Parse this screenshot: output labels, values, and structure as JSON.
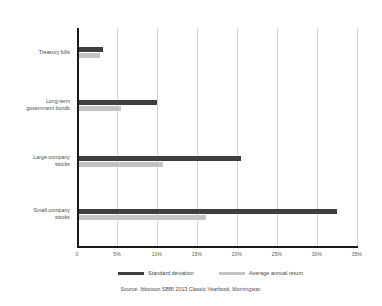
{
  "chart_data": {
    "type": "bar",
    "orientation": "horizontal",
    "title": "",
    "xlabel": "",
    "ylabel": "",
    "xlim": [
      0,
      35
    ],
    "grid": true,
    "legend_position": "bottom",
    "categories": [
      "Treasury bills",
      "Long-term government bonds",
      "Large-company stocks",
      "Small-company stocks"
    ],
    "tick_labels": [
      "0",
      "5%",
      "10%",
      "15%",
      "20%",
      "25%",
      "30%",
      "35%"
    ],
    "tick_values": [
      0,
      5,
      10,
      15,
      20,
      25,
      30,
      35
    ],
    "series": [
      {
        "name": "Standard deviation",
        "color": "#3f3f3f",
        "values": [
          3.0,
          9.7,
          20.2,
          32.3
        ]
      },
      {
        "name": "Average annual return",
        "color": "#c3c3c3",
        "values": [
          2.6,
          5.2,
          10.5,
          15.9
        ]
      }
    ],
    "source": "Source: Ibbotson SBBI 2013 Classic Yearbook, Morningstar."
  },
  "categories_display": [
    {
      "line1": "Treasury bills",
      "line2": ""
    },
    {
      "line1": "Long-term",
      "line2": "government bonds"
    },
    {
      "line1": "Large-company",
      "line2": "stocks"
    },
    {
      "line1": "Small-company",
      "line2": "stocks"
    }
  ],
  "legend": {
    "items": [
      {
        "label": "Standard deviation"
      },
      {
        "label": "Average annual return"
      }
    ]
  },
  "footer": {
    "source": "Source: Ibbotson SBBI 2013 Classic Yearbook, Morningstar."
  }
}
